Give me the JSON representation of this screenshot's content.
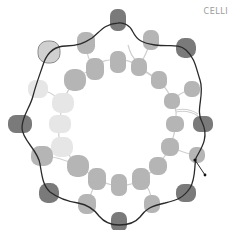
{
  "figure": {
    "label": "CELLI",
    "colors": {
      "dark_bead": "#7a7a7a",
      "medium_bead": "#b5b5b5",
      "light_bead": "#e6e6e6",
      "outline_bead": "#d0d0d0",
      "boundary_line": "#2a2a2a",
      "link_line": "#c8c8c8"
    },
    "outer_beads": [
      {
        "x": 118,
        "y": 20,
        "rx": 8,
        "ry": 11,
        "tone": "dark"
      },
      {
        "x": 186,
        "y": 48,
        "rx": 10,
        "ry": 10,
        "tone": "dark"
      },
      {
        "x": 203,
        "y": 124,
        "rx": 10,
        "ry": 8,
        "tone": "dark"
      },
      {
        "x": 186,
        "y": 193,
        "rx": 10,
        "ry": 9,
        "tone": "dark"
      },
      {
        "x": 119,
        "y": 222,
        "rx": 8,
        "ry": 10,
        "tone": "dark"
      },
      {
        "x": 49,
        "y": 193,
        "rx": 10,
        "ry": 10,
        "tone": "dark"
      },
      {
        "x": 20,
        "y": 124,
        "rx": 12,
        "ry": 9,
        "tone": "dark"
      },
      {
        "x": 49,
        "y": 52,
        "rx": 11,
        "ry": 11,
        "tone": "outline"
      }
    ],
    "middle_beads": [
      {
        "x": 86,
        "y": 43,
        "rx": 9,
        "ry": 11,
        "tone": "medium"
      },
      {
        "x": 151,
        "y": 40,
        "rx": 8,
        "ry": 10,
        "tone": "medium"
      },
      {
        "x": 192,
        "y": 89,
        "rx": 8,
        "ry": 8,
        "tone": "medium"
      },
      {
        "x": 197,
        "y": 155,
        "rx": 8,
        "ry": 8,
        "tone": "medium"
      },
      {
        "x": 152,
        "y": 204,
        "rx": 8,
        "ry": 9,
        "tone": "medium"
      },
      {
        "x": 87,
        "y": 204,
        "rx": 9,
        "ry": 10,
        "tone": "medium"
      },
      {
        "x": 42,
        "y": 156,
        "rx": 11,
        "ry": 10,
        "tone": "medium"
      },
      {
        "x": 38,
        "y": 89,
        "rx": 10,
        "ry": 9,
        "tone": "light"
      }
    ],
    "inner_beads": [
      {
        "x": 95,
        "y": 69,
        "rx": 9,
        "ry": 11,
        "tone": "medium"
      },
      {
        "x": 118,
        "y": 62,
        "rx": 8,
        "ry": 11,
        "tone": "medium"
      },
      {
        "x": 139,
        "y": 67,
        "rx": 8,
        "ry": 9,
        "tone": "medium"
      },
      {
        "x": 159,
        "y": 80,
        "rx": 8,
        "ry": 9,
        "tone": "medium"
      },
      {
        "x": 172,
        "y": 101,
        "rx": 8,
        "ry": 8,
        "tone": "medium"
      },
      {
        "x": 175,
        "y": 124,
        "rx": 9,
        "ry": 8,
        "tone": "medium"
      },
      {
        "x": 170,
        "y": 147,
        "rx": 9,
        "ry": 9,
        "tone": "medium"
      },
      {
        "x": 158,
        "y": 166,
        "rx": 9,
        "ry": 9,
        "tone": "medium"
      },
      {
        "x": 141,
        "y": 179,
        "rx": 9,
        "ry": 11,
        "tone": "medium"
      },
      {
        "x": 119,
        "y": 185,
        "rx": 8,
        "ry": 11,
        "tone": "medium"
      },
      {
        "x": 97,
        "y": 179,
        "rx": 9,
        "ry": 11,
        "tone": "medium"
      },
      {
        "x": 78,
        "y": 166,
        "rx": 11,
        "ry": 11,
        "tone": "medium"
      },
      {
        "x": 62,
        "y": 147,
        "rx": 11,
        "ry": 10,
        "tone": "light"
      },
      {
        "x": 60,
        "y": 124,
        "rx": 11,
        "ry": 9,
        "tone": "light"
      },
      {
        "x": 63,
        "y": 103,
        "rx": 11,
        "ry": 10,
        "tone": "light"
      },
      {
        "x": 75,
        "y": 80,
        "rx": 11,
        "ry": 11,
        "tone": "medium"
      }
    ],
    "boundary_path": "M118,23 C123,22 130,25 133,32 C137,40 142,43 155,45 C170,47 178,43 186,50 C195,58 196,68 200,80 C205,95 195,110 202,122 C210,138 200,150 196,158 C194,166 196,178 190,188 C184,197 178,200 165,203 C150,206 145,210 140,217 C135,223 128,225 119,225 C110,225 104,222 99,216 C94,209 88,205 78,203 C65,201 58,198 50,192 C43,186 42,176 40,164 C38,150 22,140 22,128 C22,116 30,108 33,96 C36,84 40,74 44,62 C48,52 56,46 66,46 C78,46 84,43 92,38 C100,32 104,24 118,23",
    "arrow_tail": {
      "x1": 195,
      "y1": 160,
      "x2": 205,
      "y2": 175
    }
  }
}
